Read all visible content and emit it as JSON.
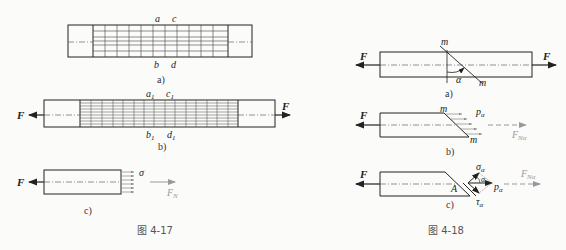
{
  "figure_4_17": {
    "caption": "图    4-17",
    "panel_a": {
      "label": "a)",
      "top_labels": [
        "a",
        "c"
      ],
      "bottom_labels": [
        "b",
        "d"
      ]
    },
    "panel_b": {
      "label": "b)",
      "top_labels": [
        "a",
        "c"
      ],
      "bottom_labels": [
        "b",
        "d"
      ],
      "subscript": "1",
      "force": "F"
    },
    "panel_c": {
      "label": "c)",
      "force": "F",
      "stress": "σ",
      "resultant": "F",
      "resultant_sub": "N"
    }
  },
  "figure_4_18": {
    "caption": "图    4-18",
    "panel_a": {
      "label": "a)",
      "force": "F",
      "section": "m",
      "angle": "α"
    },
    "panel_b": {
      "label": "b)",
      "force": "F",
      "section": "m",
      "stress": "p",
      "stress_sub": "α",
      "resultant": "F",
      "resultant_sub": "Nα"
    },
    "panel_c": {
      "label": "c)",
      "force": "F",
      "point": "A",
      "normal": "σ",
      "shear": "τ",
      "total": "p",
      "sub": "α",
      "angle": "α",
      "resultant": "F",
      "resultant_sub": "Nα"
    }
  }
}
